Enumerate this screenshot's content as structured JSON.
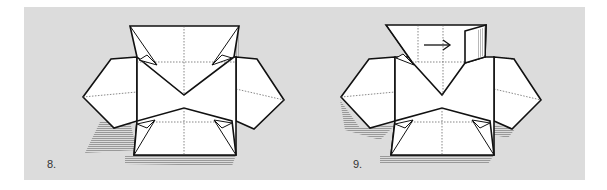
{
  "figure": {
    "type": "origami-instruction-diagram",
    "background_color": "#dcdcdc",
    "steps": [
      {
        "number_label": "8.",
        "description": "Partially folded box base with side flaps; shaded back surfaces"
      },
      {
        "number_label": "9.",
        "description": "Fold top-right flap in direction of arrow",
        "arrow": "right-arrow"
      }
    ]
  }
}
